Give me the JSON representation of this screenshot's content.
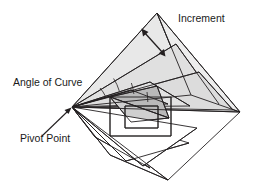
{
  "figure": {
    "background_color": "#ffffff",
    "stroke_color": "#231f20",
    "fill_light": "#e6e6e6",
    "fill_mid": "#c9c9c9",
    "fill_white": "#ffffff",
    "stroke_width": 0.9
  },
  "labels": {
    "increment": "Increment",
    "angle_of_curve": "Angle of Curve",
    "pivot_point": "Pivot Point"
  },
  "annotations": {
    "increment_arrow": {
      "name": "double-headed-arrow",
      "from": [
        143,
        31
      ],
      "to": [
        164,
        54
      ],
      "heads": "both"
    },
    "pivot_leader": {
      "name": "leader-arrow",
      "from": [
        40,
        137
      ],
      "to": [
        70,
        109
      ],
      "heads": "end"
    }
  },
  "geometry": {
    "pivot": [
      72,
      107
    ],
    "outer_apex_top": [
      157,
      13
    ],
    "outer_apex_right": [
      240,
      112
    ],
    "outer_apex_bottom": [
      168,
      180
    ],
    "angle_arcs": [
      {
        "cx": 72,
        "cy": 107,
        "r": 34,
        "a0": -49,
        "a1": -30
      },
      {
        "cx": 72,
        "cy": 107,
        "r": 48,
        "a0": -30,
        "a1": -15
      },
      {
        "cx": 72,
        "cy": 107,
        "r": 62,
        "a0": -15,
        "a1": -3
      },
      {
        "cx": 72,
        "cy": 107,
        "r": 76,
        "a0": -3,
        "a1": 8
      }
    ],
    "triangles": [
      {
        "id": "t1",
        "fill": "#e6e6e6",
        "points": "72,107 157,13 191,95"
      },
      {
        "id": "t2",
        "fill": "#e6e6e6",
        "points": "72,107 191,95 240,112"
      },
      {
        "id": "t3",
        "fill": "#e6e6e6",
        "points": "72,107 176,45 222,105"
      },
      {
        "id": "t4",
        "fill": "#e6e6e6",
        "points": "72,107 197,70 233,110"
      },
      {
        "id": "t5",
        "fill": "#e6e6e6",
        "points": "72,107 150,82 186,106"
      },
      {
        "id": "t6",
        "fill": "#c9c9c9",
        "points": "110,96 158,86 168,117"
      },
      {
        "id": "t7",
        "fill": "#ffffff",
        "points": "72,107 112,152 168,180"
      },
      {
        "id": "t8",
        "fill": "#ffffff",
        "points": "72,107 96,139 152,170"
      },
      {
        "id": "t9",
        "fill": "#ffffff",
        "points": "72,107 126,160 186,145"
      }
    ],
    "spokes": [
      [
        72,
        107,
        157,
        13
      ],
      [
        72,
        107,
        240,
        112
      ],
      [
        72,
        107,
        168,
        180
      ],
      [
        72,
        107,
        176,
        45
      ],
      [
        72,
        107,
        197,
        70
      ],
      [
        72,
        107,
        150,
        82
      ],
      [
        72,
        107,
        112,
        152
      ],
      [
        72,
        107,
        96,
        139
      ],
      [
        72,
        107,
        126,
        160
      ]
    ]
  }
}
